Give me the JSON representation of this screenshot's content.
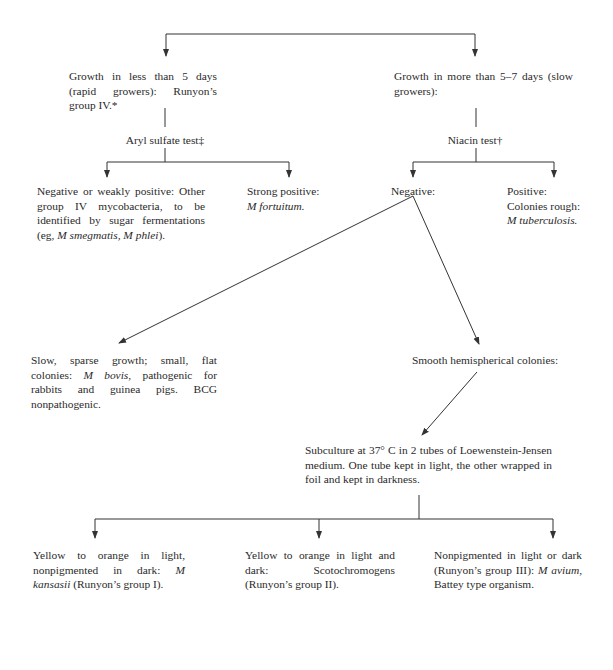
{
  "diagram": {
    "type": "flowchart",
    "colors": {
      "line": "#333333",
      "text": "#2a2a2a",
      "background": "#ffffff"
    },
    "nodes": {
      "rapid": {
        "text_a": "Growth in less than 5 days (rapid growers): Runyon’s group IV.*"
      },
      "slow": {
        "text_a": "Growth in more than 5–7 days (slow growers):"
      },
      "aryl": {
        "text_a": "Aryl sulfate test‡"
      },
      "niacin": {
        "text_a": "Niacin test†"
      },
      "aryl_neg": {
        "text_a": "Negative or weakly positive: Other group IV mycobacteria, to be identified by sugar fermentations (eg, ",
        "italic_a": "M smegmatis, M phlei",
        "text_b": ")."
      },
      "aryl_pos": {
        "text_a": "Strong positive:",
        "italic_a": "M fortuitum."
      },
      "niacin_neg": {
        "text_a": "Negative:"
      },
      "niacin_pos": {
        "text_a": "Positive:",
        "text_b": "Colonies rough:",
        "italic_a": "M tuberculosis."
      },
      "bovis": {
        "text_a": "Slow, sparse growth; small, flat colonies: ",
        "italic_a": "M bovis",
        "text_b": ", pathogenic for rabbits and guinea pigs. BCG nonpathogenic."
      },
      "smooth": {
        "text_a": "Smooth hemispherical colonies:"
      },
      "subculture": {
        "text_a": "Subculture at 37° C in 2 tubes of Loewenstein-Jensen medium. One tube kept in light, the other wrapped in foil and kept in darkness."
      },
      "group1": {
        "text_a": "Yellow to orange in light, nonpigmented in dark: ",
        "italic_a": "M kansasii",
        "text_b": " (Runyon’s group I)."
      },
      "group2": {
        "text_a": "Yellow to orange in light and dark: Scotochromogens (Runyon’s group II)."
      },
      "group3": {
        "text_a": "Nonpigmented in light or dark (Runyon’s group III): ",
        "italic_a": "M avium",
        "text_b": ", Battey type organism."
      }
    }
  }
}
